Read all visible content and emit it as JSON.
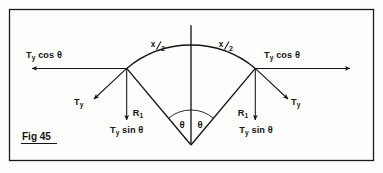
{
  "figure": {
    "caption": "Fig 45",
    "width": 383,
    "height": 173,
    "background_color": "#fdfdfb",
    "ink_color": "#141414",
    "frame_color": "#1a1a1a"
  },
  "labels": {
    "tension_symbol": "T",
    "tension_subscript": "y",
    "horizontal_component_left": "Ty cos θ",
    "horizontal_component_right": "Ty cos θ",
    "resultant_left": "Ty",
    "resultant_right": "Ty",
    "vertical_component_left": "Ty sin θ",
    "vertical_component_right": "Ty sin θ",
    "radius_left": "R",
    "radius_left_subscript": "1",
    "radius_right": "R",
    "radius_right_subscript": "1",
    "arc_left_numerator": "x",
    "arc_left_denominator": "2",
    "arc_left_full": "x/2",
    "arc_right_numerator": "x",
    "arc_right_denominator": "2",
    "arc_right_full": "x/2",
    "angle_left": "θ",
    "angle_right": "θ",
    "cos_text": "cos",
    "sin_text": "sin"
  },
  "geometry": {
    "apex_x": 191,
    "apex_y": 145,
    "radius": 100,
    "half_angle_deg": 40,
    "left_node_x": 126,
    "left_node_y": 69,
    "right_node_x": 256,
    "right_node_y": 69,
    "arc_top_x": 191,
    "arc_top_y": 26
  },
  "frame": {
    "x": 9,
    "y": 9,
    "width": 365,
    "height": 152
  }
}
